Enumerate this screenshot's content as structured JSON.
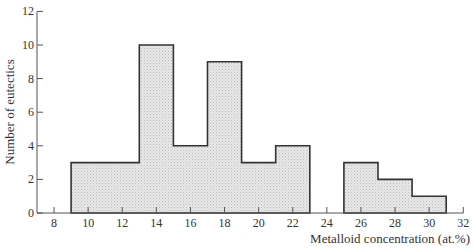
{
  "chart_data": {
    "type": "bar",
    "title": "",
    "xlabel": "Metalloid concentration (at.%)",
    "ylabel": "Number of eutectics",
    "xlim": [
      7,
      32
    ],
    "ylim": [
      0,
      12
    ],
    "xticks": [
      8,
      10,
      12,
      14,
      16,
      18,
      20,
      22,
      24,
      26,
      28,
      30,
      32
    ],
    "yticks": [
      0,
      2,
      4,
      6,
      8,
      10,
      12
    ],
    "grid": false,
    "legend": null,
    "bins": [
      {
        "from": 9,
        "to": 13,
        "value": 3
      },
      {
        "from": 13,
        "to": 15,
        "value": 10
      },
      {
        "from": 15,
        "to": 17,
        "value": 4
      },
      {
        "from": 17,
        "to": 19,
        "value": 9
      },
      {
        "from": 19,
        "to": 21,
        "value": 3
      },
      {
        "from": 21,
        "to": 23,
        "value": 4
      },
      {
        "from": 23,
        "to": 25,
        "value": 0
      },
      {
        "from": 25,
        "to": 27,
        "value": 3
      },
      {
        "from": 27,
        "to": 29,
        "value": 2
      },
      {
        "from": 29,
        "to": 31,
        "value": 1
      }
    ],
    "categories": [
      "9-13",
      "13-15",
      "15-17",
      "17-19",
      "19-21",
      "21-23",
      "23-25",
      "25-27",
      "27-29",
      "29-31"
    ],
    "values": [
      3,
      10,
      4,
      9,
      3,
      4,
      0,
      3,
      2,
      1
    ]
  },
  "labels": {
    "xlabel": "Metalloid concentration (at.%)",
    "ylabel": "Number of eutectics"
  },
  "colors": {
    "fill": "#e4e4e4",
    "outline": "#333333"
  }
}
